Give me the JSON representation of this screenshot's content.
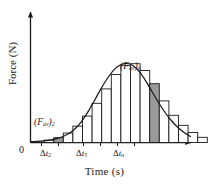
{
  "figure": {
    "name": "impulse-force-time-histogram",
    "background": "#ffffff",
    "ink_color": "#1a1a1a",
    "shade_color": "#9a9a9a",
    "origin_label": "0"
  },
  "axes": {
    "y_label": "Force (N)",
    "x_label": "Time  (s)",
    "x_arrow": true,
    "y_arrow": true
  },
  "annotations": {
    "fav_n": {
      "base": "(F",
      "sub1": "av",
      "mid": ")",
      "sub2": "n"
    },
    "fav_2": {
      "base": "(F",
      "sub1": "av",
      "mid": ")",
      "sub2": "2"
    }
  },
  "ticks": [
    {
      "id": "t2",
      "delta": "Δ",
      "var": "t",
      "sub": "2"
    },
    {
      "id": "t5",
      "delta": "Δ",
      "var": "t",
      "sub": "5"
    },
    {
      "id": "tn",
      "delta": "Δ",
      "var": "t",
      "sub": "n"
    }
  ],
  "chart_data": {
    "type": "area",
    "title": "",
    "xlabel": "Time  (s)",
    "ylabel": "Force (N)",
    "xlim": [
      0,
      1
    ],
    "ylim": [
      0,
      1
    ],
    "grid": false,
    "legend": null,
    "curve": {
      "name": "force-pulse",
      "x": [
        0.0,
        0.04,
        0.08,
        0.12,
        0.16,
        0.2,
        0.24,
        0.28,
        0.32,
        0.36,
        0.4,
        0.44,
        0.48,
        0.52,
        0.56,
        0.6,
        0.64,
        0.68,
        0.72,
        0.76,
        0.8,
        0.84,
        0.88,
        0.92,
        0.96,
        1.0
      ],
      "y": [
        0.01,
        0.014,
        0.02,
        0.03,
        0.046,
        0.072,
        0.112,
        0.175,
        0.265,
        0.385,
        0.525,
        0.67,
        0.8,
        0.905,
        0.968,
        0.99,
        0.962,
        0.885,
        0.77,
        0.635,
        0.5,
        0.378,
        0.275,
        0.19,
        0.125,
        0.075
      ]
    },
    "bars": {
      "note": "inscribed rectangles, heights normalized 0-1, left edge and width in normalized x",
      "items": [
        {
          "index": 1,
          "x0": 0.085,
          "w": 0.06,
          "h": 0.03,
          "shaded": false
        },
        {
          "index": 2,
          "x0": 0.145,
          "w": 0.06,
          "h": 0.06,
          "shaded": true,
          "label": "fav_2"
        },
        {
          "index": 3,
          "x0": 0.205,
          "w": 0.06,
          "h": 0.118,
          "shaded": false
        },
        {
          "index": 4,
          "x0": 0.265,
          "w": 0.06,
          "h": 0.205,
          "shaded": false
        },
        {
          "index": 5,
          "x0": 0.325,
          "w": 0.06,
          "h": 0.33,
          "shaded": false
        },
        {
          "index": 6,
          "x0": 0.385,
          "w": 0.06,
          "h": 0.49,
          "shaded": false
        },
        {
          "index": 7,
          "x0": 0.445,
          "w": 0.06,
          "h": 0.67,
          "shaded": false
        },
        {
          "index": 8,
          "x0": 0.505,
          "w": 0.06,
          "h": 0.85,
          "shaded": false
        },
        {
          "index": 9,
          "x0": 0.565,
          "w": 0.06,
          "h": 0.96,
          "shaded": false
        },
        {
          "index": 10,
          "x0": 0.625,
          "w": 0.06,
          "h": 0.985,
          "shaded": false
        },
        {
          "index": 11,
          "x0": 0.685,
          "w": 0.06,
          "h": 0.9,
          "shaded": false
        },
        {
          "index": 12,
          "x0": 0.745,
          "w": 0.06,
          "h": 0.735,
          "shaded": true,
          "label": "fav_n"
        },
        {
          "index": 13,
          "x0": 0.805,
          "w": 0.06,
          "h": 0.52,
          "shaded": false
        },
        {
          "index": 14,
          "x0": 0.865,
          "w": 0.06,
          "h": 0.34,
          "shaded": false
        },
        {
          "index": 15,
          "x0": 0.925,
          "w": 0.06,
          "h": 0.215,
          "shaded": false
        },
        {
          "index": 16,
          "x0": 0.985,
          "w": 0.06,
          "h": 0.125,
          "shaded": false
        },
        {
          "index": 17,
          "x0": 1.045,
          "w": 0.06,
          "h": 0.065,
          "shaded": false
        }
      ]
    }
  }
}
